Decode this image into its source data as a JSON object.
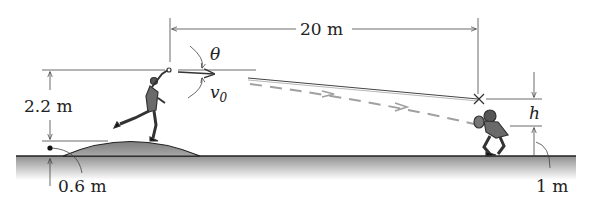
{
  "figure": {
    "labels": {
      "horizontal_distance": "20 m",
      "release_height": "2.2 m",
      "mound_height": "0.6 m",
      "catch_height": "1 m",
      "angle": "θ",
      "velocity": "v",
      "velocity_sub": "0",
      "height_diff": "h"
    },
    "colors": {
      "ground": "#9a9a9a",
      "mound": "#8c8c8c",
      "line": "#333333",
      "trajectory_dash": "#a0a0a0"
    }
  }
}
